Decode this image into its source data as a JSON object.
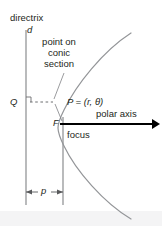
{
  "figure": {
    "background_color": "#ffffff",
    "line_color": "#808285",
    "text_color": "#231f20",
    "axis_color": "#000000",
    "footer_band_color": "#f1f1f2"
  },
  "labels": {
    "directrix": "directrix",
    "directrix_symbol": "d",
    "point_on_conic": "point on conic section",
    "Q": "Q",
    "P": "P = (r, θ)",
    "polar_axis": "polar axis",
    "F": "F",
    "focus": "focus",
    "p": "p"
  },
  "geometry": {
    "directrix_x": 26,
    "directrix_y_top": 30,
    "directrix_y_bottom": 205,
    "focus_x": 63,
    "focus_line_y_top": 117,
    "focus_line_y_bottom": 205,
    "vertex_x": 46,
    "vertex_y": 128,
    "polar_axis_y": 124,
    "polar_axis_x_start": 60,
    "polar_axis_x_end": 157,
    "P_point_x": 54,
    "P_point_y": 102,
    "Q_point_x": 26,
    "Q_point_y": 102,
    "p_arrow_y": 192
  }
}
